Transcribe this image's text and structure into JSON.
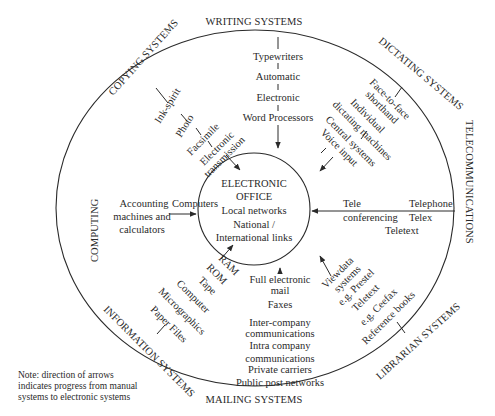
{
  "center": {
    "title_line1": "ELECTRONIC",
    "title_line2": "OFFICE",
    "line3": "Local networks",
    "line4": "National /",
    "line5": "International links"
  },
  "systems": {
    "writing": "WRITING SYSTEMS",
    "dictating": "DICTATING SYSTEMS",
    "telecommunications": "TELECOMMUNICATIONS",
    "librarian": "LIBRARIAN SYSTEMS",
    "mailing": "MAILING SYSTEMS",
    "information": "INFORMATION SYSTEMS",
    "computing": "COMPUTING",
    "copying": "COPYING SYSTEMS"
  },
  "writing_chain": [
    "Typewriters",
    "Automatic",
    "Electronic",
    "Word Processors"
  ],
  "copying_chain": [
    "Ink-spirit",
    "Photo",
    "Facsimile",
    "Electronic",
    "transmission"
  ],
  "dictating_chain": [
    "Face-to-face",
    "shorthand",
    "Individual",
    "dictating machines",
    "Central systems",
    "Voice input"
  ],
  "computing_chain": {
    "source_line1": "Accounting",
    "source_line2": "machines and",
    "source_line3": "calculators",
    "target": "Computers"
  },
  "telecom_chain": {
    "source1": "Telephone",
    "source2": "Telex",
    "source3": "Teletext",
    "target_line1": "Tele",
    "target_line2": "conferencing"
  },
  "information_chain": [
    "Paper Files",
    "Micrographics",
    "Computer",
    "Tape",
    "ROM",
    "RAM"
  ],
  "mailing_chain": [
    "Public post networks",
    "Private carriers",
    "Intra company",
    "communications",
    "Inter-company",
    "communications",
    "Faxes",
    "Full electronic",
    "mail"
  ],
  "librarian_chain": [
    "Reference books",
    "e.g. Ceefax",
    "Teletext",
    "e.g. Prestel",
    "systems",
    "Viewdata"
  ],
  "note": {
    "line1": "Note: direction of arrows",
    "line2": "indicates progress from manual",
    "line3": "systems to electronic systems"
  }
}
